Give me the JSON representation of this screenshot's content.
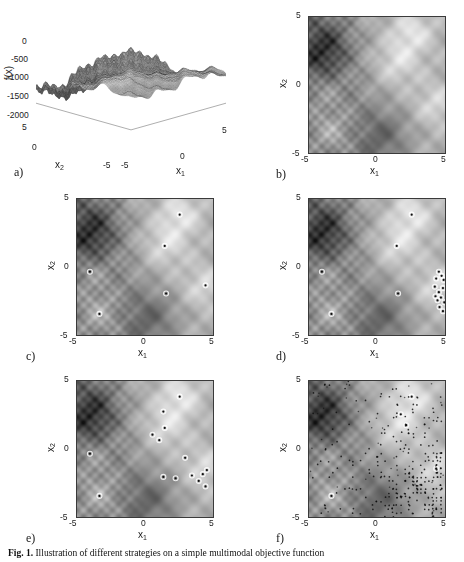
{
  "figure": {
    "caption_label": "Fig. 1.",
    "caption_text": "Illustration of different strategies on a simple multimodal objective function"
  },
  "panels": [
    {
      "id": "a",
      "letter": "a)",
      "type": "surface3d",
      "xlabel": "x_1",
      "ylabel": "x_2",
      "zlabel": "f(x)",
      "z_ticks": [
        "0",
        "-500",
        "-1000",
        "-1500",
        "-2000"
      ],
      "x_ticks": [
        "-5",
        "0",
        "5"
      ],
      "y_ticks": [
        "5",
        "0",
        "-5"
      ],
      "zlim": [
        -2100,
        100
      ],
      "xlim": [
        -5,
        5
      ],
      "ylim": [
        -5,
        5
      ]
    },
    {
      "id": "b",
      "letter": "b)",
      "type": "heatmap",
      "xlabel": "x_1",
      "ylabel": "x_2",
      "x_ticks": [
        "-5",
        "0",
        "5"
      ],
      "y_ticks": [
        "5",
        "0",
        "-5"
      ],
      "xlim": [
        -5,
        5
      ],
      "ylim": [
        -5,
        5
      ],
      "points": []
    },
    {
      "id": "c",
      "letter": "c)",
      "type": "heatmap",
      "xlabel": "x_1",
      "ylabel": "x_2",
      "x_ticks": [
        "-5",
        "0",
        "5"
      ],
      "y_ticks": [
        "5",
        "0",
        "-5"
      ],
      "xlim": [
        -5,
        5
      ],
      "ylim": [
        -5,
        5
      ],
      "points": [
        [
          2.55,
          3.85
        ],
        [
          1.45,
          1.55
        ],
        [
          -4.05,
          -0.35
        ],
        [
          1.55,
          -1.95
        ],
        [
          4.45,
          -1.35
        ],
        [
          -3.35,
          -3.45
        ]
      ]
    },
    {
      "id": "d",
      "letter": "d)",
      "type": "heatmap",
      "xlabel": "x_1",
      "ylabel": "x_2",
      "x_ticks": [
        "-5",
        "0",
        "5"
      ],
      "y_ticks": [
        "5",
        "0",
        "-5"
      ],
      "xlim": [
        -5,
        5
      ],
      "ylim": [
        -5,
        5
      ],
      "points": [
        [
          2.55,
          3.85
        ],
        [
          1.45,
          1.55
        ],
        [
          -4.05,
          -0.35
        ],
        [
          1.55,
          -1.95
        ],
        [
          -3.35,
          -3.45
        ],
        [
          4.55,
          -0.35
        ],
        [
          4.75,
          -0.65
        ],
        [
          4.35,
          -0.85
        ],
        [
          4.9,
          -0.95
        ],
        [
          4.25,
          -1.45
        ],
        [
          4.85,
          -1.55
        ],
        [
          4.55,
          -1.85
        ],
        [
          4.3,
          -2.15
        ],
        [
          4.7,
          -2.25
        ],
        [
          4.45,
          -2.45
        ],
        [
          4.95,
          -2.6
        ],
        [
          4.6,
          -2.95
        ],
        [
          4.85,
          -3.25
        ]
      ]
    },
    {
      "id": "e",
      "letter": "e)",
      "type": "heatmap",
      "xlabel": "x_1",
      "ylabel": "x_2",
      "x_ticks": [
        "-5",
        "0",
        "5"
      ],
      "y_ticks": [
        "5",
        "0",
        "-5"
      ],
      "xlim": [
        -5,
        5
      ],
      "ylim": [
        -5,
        5
      ],
      "points": [
        [
          2.55,
          3.85
        ],
        [
          1.35,
          2.75
        ],
        [
          1.45,
          1.55
        ],
        [
          0.55,
          1.05
        ],
        [
          1.05,
          0.65
        ],
        [
          -4.05,
          -0.35
        ],
        [
          2.95,
          -0.65
        ],
        [
          1.35,
          -2.05
        ],
        [
          2.25,
          -2.15
        ],
        [
          3.45,
          -1.95
        ],
        [
          4.25,
          -1.85
        ],
        [
          4.55,
          -1.55
        ],
        [
          3.95,
          -2.35
        ],
        [
          4.45,
          -2.75
        ],
        [
          -3.35,
          -3.45
        ]
      ]
    },
    {
      "id": "f",
      "letter": "f)",
      "type": "heatmap_dense",
      "xlabel": "x_1",
      "ylabel": "x_2",
      "x_ticks": [
        "-5",
        "0",
        "5"
      ],
      "y_ticks": [
        "5",
        "0",
        "-5"
      ],
      "xlim": [
        -5,
        5
      ],
      "ylim": [
        -5,
        5
      ],
      "points": [
        [
          2.55,
          3.85
        ],
        [
          1.75,
          2.55
        ],
        [
          2.15,
          1.75
        ],
        [
          -3.35,
          -3.45
        ],
        [
          4.35,
          -1.45
        ]
      ],
      "dense_seed": 7,
      "dense_count": 900
    }
  ],
  "chart_data": {
    "type": "heatmap",
    "title": "Illustration of different strategies on a simple multimodal objective function",
    "xlabel": "x_1",
    "ylabel": "x_2",
    "zlabel": "f(x)",
    "xlim": [
      -5,
      5
    ],
    "ylim": [
      -5,
      5
    ],
    "zlim": [
      -2100,
      100
    ],
    "z_tick_values": [
      0,
      -500,
      -1000,
      -1500,
      -2000
    ],
    "x_tick_values": [
      -5,
      0,
      5
    ],
    "y_tick_values": [
      -5,
      0,
      5
    ],
    "colormap": "grayscale",
    "grid": false,
    "legend": "none",
    "function_name": "schwefel-like multimodal",
    "surface_resolution": 120,
    "peaks": [
      {
        "x": 2.6,
        "y": 3.9,
        "intensity": 1.0
      },
      {
        "x": 1.5,
        "y": 1.6,
        "intensity": 0.88
      },
      {
        "x": -3.4,
        "y": -3.5,
        "intensity": 1.0
      },
      {
        "x": 4.4,
        "y": -1.4,
        "intensity": 0.8
      },
      {
        "x": -4.0,
        "y": -0.4,
        "intensity": 0.72
      }
    ],
    "valleys": [
      {
        "x": -3.6,
        "y": 3.2,
        "intensity": -1.0
      },
      {
        "x": 0.6,
        "y": -3.6,
        "intensity": -0.9
      },
      {
        "x": -4.3,
        "y": 1.6,
        "intensity": -0.8
      }
    ]
  }
}
